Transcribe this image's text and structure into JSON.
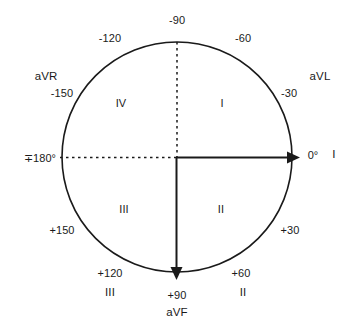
{
  "diagram": {
    "colors": {
      "stroke": "#1a1a1a",
      "text": "#1a1a1a",
      "background": "#ffffff"
    },
    "circle": {
      "cx": 177,
      "cy": 157,
      "r": 115
    },
    "axes": [
      {
        "name": "lead-I-axis",
        "style": "solid",
        "direction": "right",
        "arrow": true
      },
      {
        "name": "aVF-axis",
        "style": "solid",
        "direction": "down",
        "arrow": true
      },
      {
        "name": "minus-90-axis",
        "style": "dashed",
        "direction": "up",
        "arrow": false
      },
      {
        "name": "180-axis",
        "style": "dashed",
        "direction": "left",
        "arrow": false
      }
    ],
    "degree_labels": [
      {
        "id": "deg-minus-90",
        "text": "-90",
        "x": 177,
        "y": 20
      },
      {
        "id": "deg-minus-120",
        "text": "-120",
        "x": 110,
        "y": 38
      },
      {
        "id": "deg-minus-60",
        "text": "-60",
        "x": 243,
        "y": 38
      },
      {
        "id": "deg-minus-150",
        "text": "-150",
        "x": 62,
        "y": 93
      },
      {
        "id": "deg-minus-30",
        "text": "-30",
        "x": 289,
        "y": 93
      },
      {
        "id": "deg-180",
        "text": "∓180°",
        "x": 40,
        "y": 158
      },
      {
        "id": "deg-zero",
        "text": "0°",
        "x": 313,
        "y": 155
      },
      {
        "id": "deg-plus-150",
        "text": "+150",
        "x": 62,
        "y": 230
      },
      {
        "id": "deg-plus-30",
        "text": "+30",
        "x": 290,
        "y": 230
      },
      {
        "id": "deg-plus-120",
        "text": "+120",
        "x": 110,
        "y": 273
      },
      {
        "id": "deg-plus-60",
        "text": "+60",
        "x": 241,
        "y": 273
      },
      {
        "id": "deg-plus-90",
        "text": "+90",
        "x": 177,
        "y": 295
      }
    ],
    "lead_labels": [
      {
        "id": "lead-aVR",
        "text": "aVR",
        "x": 46,
        "y": 77
      },
      {
        "id": "lead-aVL",
        "text": "aVL",
        "x": 320,
        "y": 77
      },
      {
        "id": "lead-I",
        "text": "I",
        "x": 334,
        "y": 155
      },
      {
        "id": "lead-aVF",
        "text": "aVF",
        "x": 177,
        "y": 313
      },
      {
        "id": "lead-III",
        "text": "III",
        "x": 110,
        "y": 293
      },
      {
        "id": "lead-II",
        "text": "II",
        "x": 243,
        "y": 293
      }
    ],
    "quadrant_labels": [
      {
        "id": "quadrant-IV",
        "text": "IV",
        "x": 121,
        "y": 103
      },
      {
        "id": "quadrant-I",
        "text": "I",
        "x": 222,
        "y": 103
      },
      {
        "id": "quadrant-III",
        "text": "III",
        "x": 124,
        "y": 209
      },
      {
        "id": "quadrant-II",
        "text": "II",
        "x": 221,
        "y": 209
      }
    ]
  }
}
